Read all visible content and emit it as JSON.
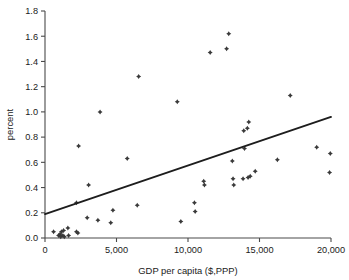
{
  "chart_data": {
    "type": "scatter",
    "title": "",
    "xlabel": "GDP per capita ($,PPP)",
    "ylabel": "percent",
    "xlim": [
      0,
      20000
    ],
    "ylim": [
      0.0,
      1.8
    ],
    "grid": false,
    "legend": null,
    "xticks": [
      0,
      5000,
      10000,
      15000,
      20000
    ],
    "xtick_labels": [
      "0",
      "5,000",
      "10,000",
      "15,000",
      "20,000"
    ],
    "yticks": [
      0.0,
      0.2,
      0.4,
      0.6,
      0.8,
      1.0,
      1.2,
      1.4,
      1.6,
      1.8
    ],
    "ytick_labels": [
      "0.0",
      "0.2",
      "0.4",
      "0.6",
      "0.8",
      "1.0",
      "1.2",
      "1.4",
      "1.6",
      "1.8"
    ],
    "marker": "diamond",
    "marker_color": "#3a3a3a",
    "points": [
      {
        "x": 600,
        "y": 0.05
      },
      {
        "x": 950,
        "y": 0.02
      },
      {
        "x": 1050,
        "y": 0.03
      },
      {
        "x": 1100,
        "y": 0.01
      },
      {
        "x": 1150,
        "y": 0.05
      },
      {
        "x": 1250,
        "y": 0.02
      },
      {
        "x": 1300,
        "y": 0.06
      },
      {
        "x": 1350,
        "y": 0.01
      },
      {
        "x": 1600,
        "y": 0.08
      },
      {
        "x": 1650,
        "y": 0.02
      },
      {
        "x": 2200,
        "y": 0.05
      },
      {
        "x": 2300,
        "y": 0.04
      },
      {
        "x": 2200,
        "y": 0.28
      },
      {
        "x": 2350,
        "y": 0.73
      },
      {
        "x": 2950,
        "y": 0.16
      },
      {
        "x": 3050,
        "y": 0.42
      },
      {
        "x": 3700,
        "y": 0.14
      },
      {
        "x": 3850,
        "y": 1.0
      },
      {
        "x": 4600,
        "y": 0.12
      },
      {
        "x": 4750,
        "y": 0.22
      },
      {
        "x": 5750,
        "y": 0.63
      },
      {
        "x": 6450,
        "y": 0.26
      },
      {
        "x": 6550,
        "y": 1.28
      },
      {
        "x": 9250,
        "y": 1.08
      },
      {
        "x": 9500,
        "y": 0.13
      },
      {
        "x": 10450,
        "y": 0.28
      },
      {
        "x": 10500,
        "y": 0.21
      },
      {
        "x": 11100,
        "y": 0.45
      },
      {
        "x": 11150,
        "y": 0.42
      },
      {
        "x": 11550,
        "y": 1.47
      },
      {
        "x": 12700,
        "y": 1.5
      },
      {
        "x": 12850,
        "y": 1.62
      },
      {
        "x": 13100,
        "y": 0.61
      },
      {
        "x": 13150,
        "y": 0.47
      },
      {
        "x": 13200,
        "y": 0.42
      },
      {
        "x": 13900,
        "y": 0.85
      },
      {
        "x": 13950,
        "y": 0.71
      },
      {
        "x": 13850,
        "y": 0.47
      },
      {
        "x": 14150,
        "y": 0.87
      },
      {
        "x": 14250,
        "y": 0.92
      },
      {
        "x": 14200,
        "y": 0.48
      },
      {
        "x": 14350,
        "y": 0.49
      },
      {
        "x": 14700,
        "y": 0.53
      },
      {
        "x": 16250,
        "y": 0.62
      },
      {
        "x": 17150,
        "y": 1.13
      },
      {
        "x": 19000,
        "y": 0.72
      },
      {
        "x": 19950,
        "y": 0.67
      },
      {
        "x": 19900,
        "y": 0.52
      }
    ],
    "trend_line": {
      "type": "linear-fit",
      "x_start": 0,
      "y_start": 0.19,
      "x_end": 20000,
      "y_end": 0.96,
      "color": "#1d1d1d"
    }
  }
}
